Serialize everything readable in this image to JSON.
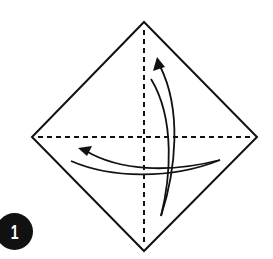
{
  "diagram": {
    "type": "origami-step",
    "step_number": "1",
    "colors": {
      "line": "#111111",
      "paper": "#ffffff",
      "badge_bg": "#111111",
      "badge_text": "#ffffff"
    },
    "paper_shape": {
      "shape": "square-rotated-45",
      "vertices": {
        "top": [
          144,
          22
        ],
        "right": [
          257,
          137
        ],
        "bottom": [
          144,
          251
        ],
        "left": [
          32,
          137
        ]
      }
    },
    "creases": [
      {
        "name": "horizontal-diagonal-crease",
        "style": "dashed",
        "from": [
          38,
          137
        ],
        "to": [
          251,
          137
        ]
      },
      {
        "name": "vertical-diagonal-crease",
        "style": "dashed",
        "from": [
          144,
          30
        ],
        "to": [
          144,
          246
        ]
      }
    ],
    "arrows": [
      {
        "name": "fold-up-arrow",
        "direction": "up",
        "tail": [
          161,
          216
        ],
        "head": [
          157,
          57
        ]
      },
      {
        "name": "fold-left-arrow",
        "direction": "left",
        "tail": [
          220,
          160
        ],
        "head": [
          78,
          148
        ]
      }
    ]
  }
}
